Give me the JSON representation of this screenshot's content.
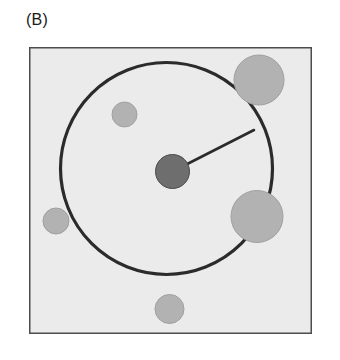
{
  "figure": {
    "panel_label": "(B)",
    "background_color": "#ffffff",
    "plot_area": {
      "fill_color": "#ebebeb",
      "border_color": "#4d4d4d",
      "border_width": 1.5,
      "x": 29,
      "y": 47,
      "width": 283,
      "height": 287
    }
  },
  "chart_data": {
    "type": "scatter",
    "title": "(B)",
    "xlabel": "",
    "ylabel": "",
    "grid": false,
    "legend": false,
    "xlim": [
      0,
      283
    ],
    "ylim": [
      0,
      287
    ],
    "annotations": [
      {
        "name": "range-circle",
        "kind": "circle-outline",
        "cx": 137.5,
        "cy": 121.5,
        "r": 106,
        "stroke_color": "#2b2b2b",
        "stroke_width": 3.2,
        "fill": "none"
      },
      {
        "name": "radius-line",
        "kind": "line",
        "x1": 143.5,
        "y1": 124.5,
        "x2": 225,
        "y2": 83,
        "stroke_color": "#2b2b2b",
        "stroke_width": 2.6
      }
    ],
    "points": [
      {
        "name": "center-node",
        "cx": 143.5,
        "cy": 124.5,
        "r": 17,
        "color": "#6e6e6e",
        "edge_color": "#4a4a4a",
        "role": "focal-node"
      },
      {
        "name": "neighbor-node-top-right",
        "cx": 230,
        "cy": 33,
        "r": 25,
        "color": "#b2b2b2",
        "edge_color": "#a0a0a0",
        "role": "neighbor-node"
      },
      {
        "name": "neighbor-node-inner-top-left",
        "cx": 95.5,
        "cy": 67.5,
        "r": 12.5,
        "color": "#b2b2b2",
        "edge_color": "#a0a0a0",
        "role": "neighbor-node"
      },
      {
        "name": "neighbor-node-right",
        "cx": 228,
        "cy": 169.5,
        "r": 26,
        "color": "#b2b2b2",
        "edge_color": "#a0a0a0",
        "role": "neighbor-node"
      },
      {
        "name": "neighbor-node-left",
        "cx": 27,
        "cy": 174,
        "r": 13,
        "color": "#b2b2b2",
        "edge_color": "#a0a0a0",
        "role": "neighbor-node"
      },
      {
        "name": "neighbor-node-bottom",
        "cx": 140.5,
        "cy": 262,
        "r": 14.5,
        "color": "#b2b2b2",
        "edge_color": "#a0a0a0",
        "role": "neighbor-node"
      }
    ]
  }
}
